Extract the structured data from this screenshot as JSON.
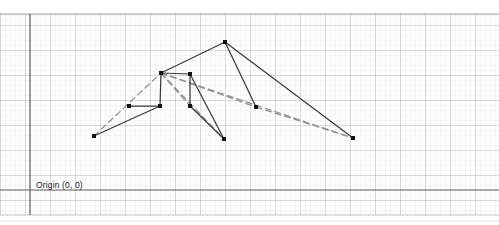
{
  "figure": {
    "kind": "grid-diagram",
    "width": 499,
    "height": 225,
    "background": "#ffffff"
  },
  "labels": {
    "origin": "Origin (0, 0)",
    "origin_x": 36,
    "origin_y": 181
  },
  "grid": {
    "minor_step": 5,
    "major_step": 25,
    "minor_color": "#dcdee2",
    "major_color": "#aeb2b8",
    "area": {
      "x": 0,
      "y": 14,
      "width": 499,
      "height": 201
    }
  },
  "axes": {
    "color": "#5a5d61",
    "width": 1.2,
    "vertical_x": 30,
    "horizontal_y": 190,
    "top_rule_y": 14,
    "bottom_rule_y": 215
  },
  "footer_rule": {
    "y": 221,
    "x1": 0,
    "x2": 499,
    "color": "#e2e3e5"
  },
  "style": {
    "solid_color": "#3a3a3a",
    "dashed_color": "#8e9094",
    "node_color": "#111111",
    "node_size": 4.0,
    "solid_width": 1.25,
    "dashed_width": 1.25,
    "dash_pattern": "6,4"
  },
  "chart_data": {
    "type": "scatter",
    "title": "",
    "xlabel": "",
    "ylabel": "",
    "grid": true,
    "legend": "none",
    "nodes": [
      {
        "id": "n1",
        "label": "left-terminal",
        "x": 94,
        "y": 136
      },
      {
        "id": "n2",
        "label": "left-low-a",
        "x": 129,
        "y": 106
      },
      {
        "id": "n3",
        "label": "left-low-b",
        "x": 160,
        "y": 106
      },
      {
        "id": "n4",
        "label": "branch-hub",
        "x": 161,
        "y": 73
      },
      {
        "id": "n5",
        "label": "mid-upper",
        "x": 190,
        "y": 74
      },
      {
        "id": "n6",
        "label": "mid-lower",
        "x": 190,
        "y": 106
      },
      {
        "id": "n7",
        "label": "apex",
        "x": 225,
        "y": 42
      },
      {
        "id": "n8",
        "label": "mid-terminal",
        "x": 224,
        "y": 139
      },
      {
        "id": "n9",
        "label": "right-mid",
        "x": 256,
        "y": 107
      },
      {
        "id": "n10",
        "label": "right-terminal",
        "x": 353,
        "y": 138
      }
    ],
    "solid_edges": [
      {
        "from": "n1",
        "to": "n3"
      },
      {
        "from": "n2",
        "to": "n3"
      },
      {
        "from": "n3",
        "to": "n4"
      },
      {
        "from": "n4",
        "to": "n5"
      },
      {
        "from": "n4",
        "to": "n7"
      },
      {
        "from": "n5",
        "to": "n6"
      },
      {
        "from": "n5",
        "to": "n8"
      },
      {
        "from": "n6",
        "to": "n8"
      },
      {
        "from": "n7",
        "to": "n9"
      },
      {
        "from": "n7",
        "to": "n10"
      }
    ],
    "dashed_edges": [
      {
        "from": "n1",
        "to": "n4"
      },
      {
        "from": "n4",
        "to": "n6"
      },
      {
        "from": "n4",
        "to": "n8"
      },
      {
        "from": "n4",
        "to": "n9"
      },
      {
        "from": "n4",
        "to": "n10"
      },
      {
        "from": "n9",
        "to": "n10"
      }
    ]
  }
}
